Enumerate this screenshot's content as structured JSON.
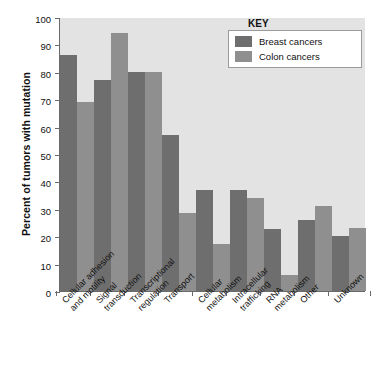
{
  "chart_data": {
    "type": "bar",
    "title": "",
    "xlabel": "",
    "ylabel": "Percent of tumors with mutation",
    "ylim": [
      0,
      100
    ],
    "ytick_step": 10,
    "yticks": [
      0,
      10,
      20,
      30,
      40,
      50,
      60,
      70,
      80,
      90,
      100
    ],
    "grid": false,
    "legend_position": "top-right",
    "legend_title": "KEY",
    "categories": [
      "Cellular adhesion and motility",
      "Signal transduction",
      "Transcriptional regulation",
      "Transport",
      "Cellular metabolism",
      "Intracellular trafficking",
      "RNA metabolism",
      "Other",
      "Unknown"
    ],
    "category_lines": [
      [
        "Cellular adhesion",
        "and motility"
      ],
      [
        "Signal",
        "transduction"
      ],
      [
        "Transcriptional",
        "regulation"
      ],
      [
        "Transport"
      ],
      [
        "Cellular",
        "metabolism"
      ],
      [
        "Intracellular",
        "trafficking"
      ],
      [
        "RNA",
        "metabolism"
      ],
      [
        "Other"
      ],
      [
        "Unknown"
      ]
    ],
    "series": [
      {
        "name": "Breast cancers",
        "color": "#6e6e6e",
        "values": [
          86,
          77,
          80,
          57,
          37,
          37,
          22.5,
          26,
          20
        ]
      },
      {
        "name": "Colon cancers",
        "color": "#8f8f8f",
        "values": [
          69,
          94,
          80,
          28.5,
          17,
          34,
          6,
          31,
          23
        ]
      }
    ]
  },
  "colors": {
    "plot_background": "#e3e3e3",
    "page_background": "#ffffff",
    "axis": "#6a6a6a",
    "text": "#111111",
    "breast": "#6e6e6e",
    "colon": "#8f8f8f"
  }
}
